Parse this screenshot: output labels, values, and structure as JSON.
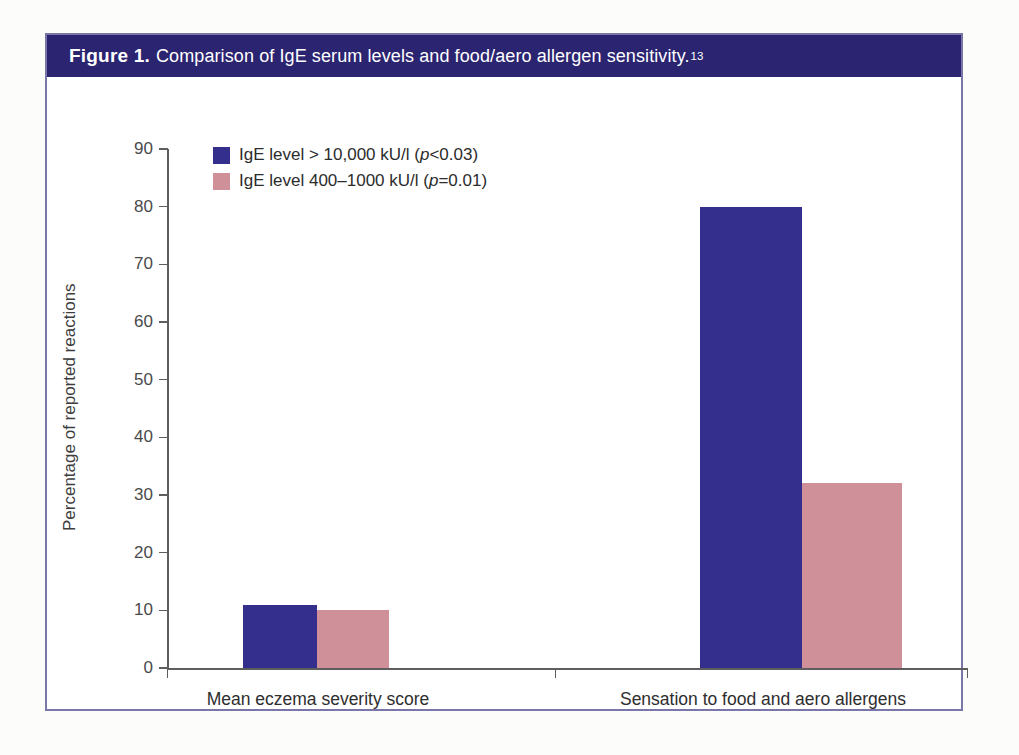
{
  "figure": {
    "label": "Figure 1.",
    "caption": "Comparison of IgE serum levels and food/aero allergen sensitivity.",
    "reference_superscript": "13"
  },
  "colors": {
    "series_1": "#342E8C",
    "series_2": "#CF9099",
    "caption_bar": "#2B2470",
    "border": "#7A76A8",
    "axis": "#5E5E5E",
    "page_background": "#FCFCFA",
    "plot_background": "#FFFFFF"
  },
  "chart_data": {
    "type": "bar",
    "title": "Comparison of IgE serum levels and food/aero allergen sensitivity.",
    "xlabel": "",
    "ylabel": "Percentage of reported reactions",
    "ylim": [
      0,
      90
    ],
    "ytick_step": 10,
    "yticks": [
      "90",
      "80",
      "70",
      "60",
      "50",
      "40",
      "30",
      "20",
      "10",
      "0"
    ],
    "grid": false,
    "legend_position": "top-left",
    "categories": [
      "Mean eczema severity score",
      "Sensation to food and aero allergens"
    ],
    "series": [
      {
        "name": "IgE level > 10,000 kU/l (p<0.03)",
        "name_plain": "IgE level > 10,000 kU/l",
        "p_value": "p<0.03",
        "color": "#342E8C",
        "values": [
          11,
          80
        ]
      },
      {
        "name": "IgE level 400–1000 kU/l (p=0.01)",
        "name_plain": "IgE level 400–1000 kU/l",
        "p_value": "p=0.01",
        "color": "#CF9099",
        "values": [
          10,
          32
        ]
      }
    ]
  },
  "legend": [
    {
      "prefix": "IgE level > 10,000 kU/l (",
      "italic": "p",
      "suffix": "<0.03)",
      "color": "#342E8C"
    },
    {
      "prefix": "IgE level 400–1000 kU/l (",
      "italic": "p",
      "suffix": "=0.01)",
      "color": "#CF9099"
    }
  ]
}
